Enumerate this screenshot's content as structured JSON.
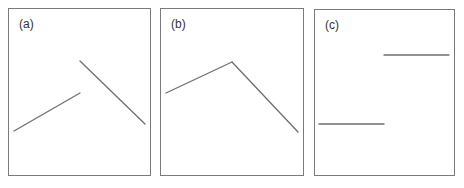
{
  "figure": {
    "line_color": "#6e6e6e",
    "border_color": "#7a7a7a",
    "panels": [
      {
        "label": "(a)",
        "box": {
          "x": 8,
          "y": 8,
          "w": 143,
          "h": 168
        },
        "description": "Two disconnected line segments: rising segment then higher falling segment (jump discontinuity)",
        "segments": [
          {
            "x1": 14,
            "y1": 131,
            "x2": 80,
            "y2": 93
          },
          {
            "x1": 80,
            "y1": 61,
            "x2": 145,
            "y2": 124
          }
        ]
      },
      {
        "label": "(b)",
        "box": {
          "x": 160,
          "y": 8,
          "w": 144,
          "h": 168
        },
        "description": "Continuous polyline: rising to a peak then falling (kink)",
        "segments": [
          {
            "x1": 166,
            "y1": 93,
            "x2": 232,
            "y2": 62
          },
          {
            "x1": 232,
            "y1": 62,
            "x2": 298,
            "y2": 132
          }
        ]
      },
      {
        "label": "(c)",
        "box": {
          "x": 314,
          "y": 9,
          "w": 141,
          "h": 167
        },
        "description": "Step function: low horizontal segment then high horizontal segment",
        "segments": [
          {
            "x1": 319,
            "y1": 124,
            "x2": 384,
            "y2": 124
          },
          {
            "x1": 384,
            "y1": 55,
            "x2": 449,
            "y2": 55
          }
        ]
      }
    ]
  }
}
